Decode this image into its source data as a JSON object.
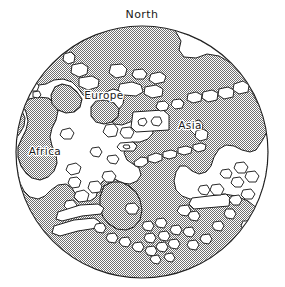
{
  "figure": {
    "kind": "hemisphere-world-map",
    "labels": {
      "north": "North",
      "europe": "Europe",
      "asia": "Asia",
      "africa": "Africa"
    },
    "colors": {
      "ink": "#1f1f1f",
      "land_fill": "#ffffff",
      "ocean_stipple": "#8f8f8f",
      "paper": "#ffffff"
    },
    "globe": {
      "center_x": 142,
      "center_y": 152,
      "radius": 126
    }
  }
}
